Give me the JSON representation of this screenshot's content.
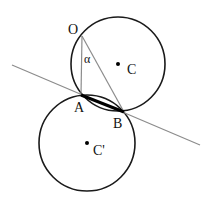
{
  "diagram": {
    "colors": {
      "circle_stroke": "#1a1a1a",
      "tangent_line": "#8c8c8c",
      "chord_oa_ob": "#8c8c8c",
      "segment_ab": "#000000"
    },
    "points": {
      "O": {
        "label": "O",
        "x": 82,
        "y": 36
      },
      "A": {
        "label": "A",
        "x": 81,
        "y": 95
      },
      "B": {
        "label": "B",
        "x": 124,
        "y": 112
      },
      "C": {
        "label": "C",
        "x": 118,
        "y": 64
      },
      "C_prime": {
        "label": "C'",
        "x": 87,
        "y": 143
      }
    },
    "angle_label": "α",
    "circles": [
      {
        "name": "upper-circle",
        "center": "C",
        "r": 47
      },
      {
        "name": "lower-circle",
        "center": "C'",
        "r": 48
      }
    ],
    "lines": [
      {
        "name": "tangent-line",
        "from": [
          12,
          65
        ],
        "to": [
          200,
          145
        ]
      },
      {
        "name": "segment-OA",
        "from": "O",
        "to": "A"
      },
      {
        "name": "segment-OB",
        "from": "O",
        "to": "B"
      },
      {
        "name": "segment-AB",
        "from": "A",
        "to": "B",
        "bold": true
      }
    ]
  }
}
